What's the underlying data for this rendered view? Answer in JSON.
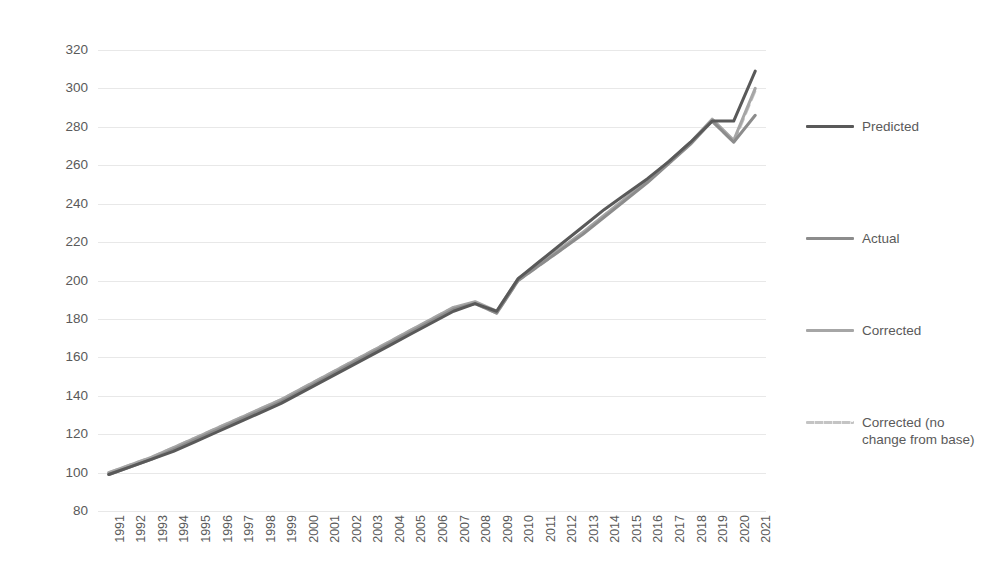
{
  "chart_data": {
    "type": "line",
    "title": "",
    "xlabel": "",
    "ylabel": "",
    "ylim": [
      80,
      320
    ],
    "ytick_step": 20,
    "yticks": [
      320,
      300,
      280,
      260,
      240,
      220,
      200,
      180,
      160,
      140,
      120,
      100,
      80
    ],
    "grid": true,
    "legend_position": "right",
    "categories": [
      "1991",
      "1992",
      "1993",
      "1994",
      "1995",
      "1996",
      "1997",
      "1998",
      "1999",
      "2000",
      "2001",
      "2002",
      "2003",
      "2004",
      "2005",
      "2006",
      "2007",
      "2008",
      "2009",
      "2010",
      "2011",
      "2012",
      "2013",
      "2014",
      "2015",
      "2016",
      "2017",
      "2018",
      "2019",
      "2020",
      "2021"
    ],
    "series": [
      {
        "name": "Predicted",
        "color": "#595959",
        "style": "solid",
        "width": 3,
        "values": [
          99,
          103,
          107,
          111,
          116,
          121,
          126,
          131,
          136,
          142,
          148,
          154,
          160,
          166,
          172,
          178,
          184,
          188,
          184,
          201,
          210,
          219,
          228,
          237,
          245,
          253,
          262,
          272,
          283,
          283,
          309
        ]
      },
      {
        "name": "Actual",
        "color": "#8c8c8c",
        "style": "solid",
        "width": 3,
        "values": [
          99,
          103,
          107,
          112,
          117,
          122,
          127,
          132,
          137,
          143,
          149,
          155,
          161,
          167,
          173,
          179,
          185,
          188,
          183,
          200,
          208,
          216,
          224,
          233,
          242,
          251,
          261,
          271,
          283,
          272,
          286
        ]
      },
      {
        "name": "Corrected",
        "color": "#a6a6a6",
        "style": "solid",
        "width": 3,
        "values": [
          100,
          104,
          108,
          113,
          118,
          123,
          128,
          133,
          138,
          144,
          150,
          156,
          162,
          168,
          174,
          180,
          186,
          189,
          184,
          201,
          209,
          217,
          225,
          234,
          243,
          252,
          262,
          272,
          284,
          273,
          300
        ]
      },
      {
        "name": "Corrected (no change from base)",
        "color": "#c4c4c4",
        "style": "dashed",
        "width": 3,
        "values": [
          100,
          104,
          108,
          113,
          118,
          123,
          128,
          133,
          138,
          144,
          150,
          156,
          162,
          168,
          174,
          180,
          186,
          188,
          183,
          200,
          208,
          216,
          225,
          234,
          243,
          252,
          262,
          272,
          283,
          272,
          299
        ]
      }
    ]
  },
  "legend": {
    "entries": [
      {
        "label": "Predicted"
      },
      {
        "label": "Actual"
      },
      {
        "label": "Corrected"
      },
      {
        "label": "Corrected (no change from base)"
      }
    ]
  }
}
